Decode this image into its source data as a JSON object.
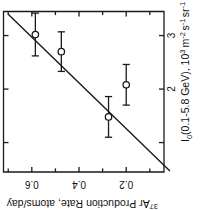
{
  "figure": {
    "orientation": "rotated-90-clockwise",
    "background": "#ffffff",
    "ink_color": "#1a1a1a"
  },
  "chart_data": {
    "type": "scatter",
    "title": "",
    "note": "Figure printed sideways (rotated 90 degrees). Axis labels read bottom-to-top / upside-down in the raster.",
    "xlabel": "I₀(0.1-5.8 GeV),  10³ m⁻² s⁻¹ sr⁻¹",
    "ylabel": "³⁷Ar Production Rate, atoms/day",
    "xlim": [
      0.45,
      3.45
    ],
    "ylim": [
      0.04,
      0.72
    ],
    "xticks": [
      1,
      2,
      3
    ],
    "xticklabels": [
      "",
      "2",
      "3"
    ],
    "yticks": [
      0.2,
      0.4,
      0.6
    ],
    "yticklabels": [
      "0.2",
      "0.4",
      "0.6"
    ],
    "grid": false,
    "legend": false,
    "marker": "open-circle",
    "errorbars": "x-direction (horizontal in data space)",
    "points": [
      {
        "x": 3.02,
        "y": 0.585,
        "xerr": 0.4,
        "label": "p1"
      },
      {
        "x": 2.7,
        "y": 0.475,
        "xerr": 0.37,
        "label": "p2"
      },
      {
        "x": 2.08,
        "y": 0.2,
        "xerr": 0.38,
        "label": "p3"
      },
      {
        "x": 1.48,
        "y": 0.275,
        "xerr": 0.38,
        "label": "p4"
      }
    ],
    "series": [
      {
        "name": "fit-line",
        "type": "line",
        "x": [
          0.47,
          3.4
        ],
        "y": [
          0.015,
          0.7
        ]
      }
    ]
  },
  "axis_label_parts": {
    "x_main": "I",
    "x_sub": "0",
    "x_paren": "(0.1-5.8 GeV),",
    "x_unit_base": "10",
    "x_unit_exp": "3",
    "x_unit_m": "m",
    "x_unit_m_exp": "-2",
    "x_unit_s": "s",
    "x_unit_s_exp": "-1",
    "x_unit_sr": "sr",
    "x_unit_sr_exp": "-1",
    "y_sup": "37",
    "y_main": "Ar Production Rate, atoms/day"
  }
}
